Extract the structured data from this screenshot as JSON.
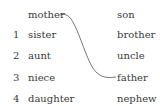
{
  "exercise": {
    "example": {
      "left": "mother",
      "right": "father"
    },
    "left_items": [
      {
        "number": "",
        "word": "mother"
      },
      {
        "number": "1",
        "word": "sister"
      },
      {
        "number": "2",
        "word": "aunt"
      },
      {
        "number": "3",
        "word": "niece"
      },
      {
        "number": "4",
        "word": "daughter"
      }
    ],
    "right_items": [
      "son",
      "brother",
      "uncle",
      "father",
      "nephew"
    ]
  }
}
